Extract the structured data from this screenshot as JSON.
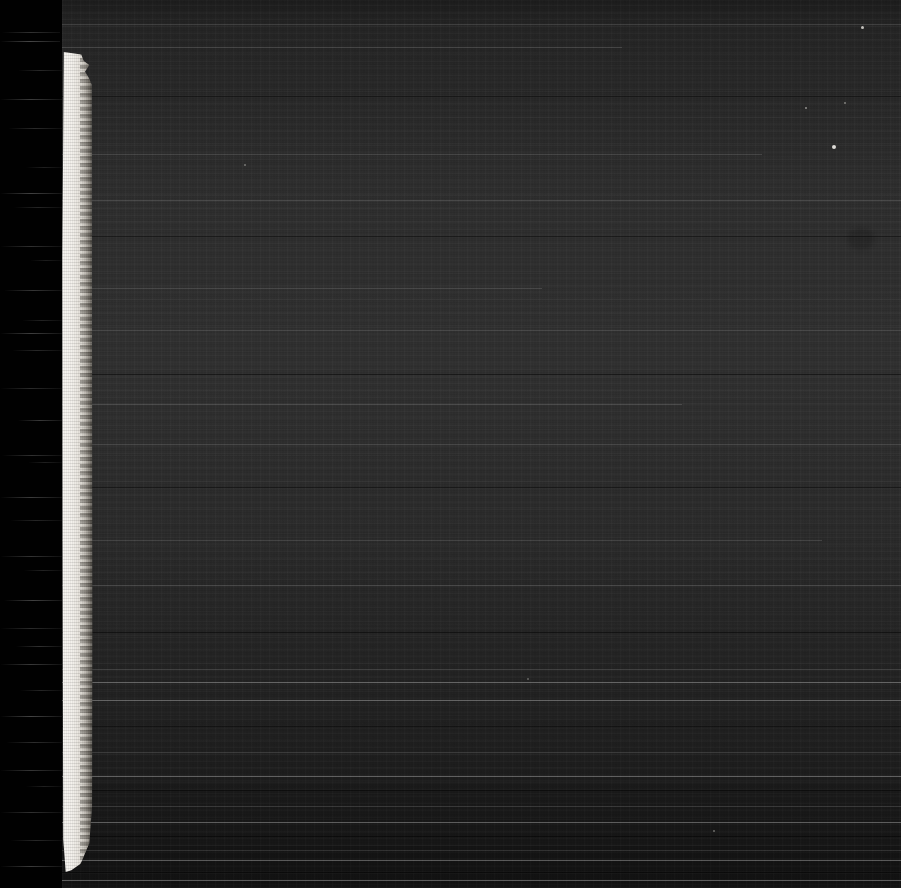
{
  "document": {
    "kind": "scanned-microfilm-frame",
    "title": "Scanned microfilm frame",
    "width_px": 901,
    "height_px": 888,
    "description": "Under-exposed scanned microfilm / microfiche frame. A pure black margin band runs down the left edge, a bright frayed white film-edge strip sits beside it, and the remainder is a dark noisy grey scan field with horizontal banding and a few dust specks. No legible text is present in the frame."
  },
  "regions": {
    "black_margin": {
      "name": "black-margin-band",
      "label": "Black margin band",
      "x": 0,
      "y": 0,
      "width": 62,
      "height": 888,
      "color": "#010101"
    },
    "film_edge_strip": {
      "name": "film-edge-strip",
      "label": "White film edge strip",
      "x": 62,
      "y": 52,
      "width": 31,
      "height": 820,
      "color_bright": "#f6f4f0",
      "color_mid": "#e6e2db",
      "color_edge": "#7d786f",
      "top_shape": "frayed notched tip with small rightward protrusion",
      "bottom_shape": "tapered angled termination"
    },
    "scan_field": {
      "name": "dark-scan-field",
      "label": "Dark scan field",
      "x": 62,
      "y": 0,
      "width": 839,
      "height": 888,
      "color_base": "#272727",
      "color_light_band": "#2e2e2e",
      "color_dark_band": "#161616",
      "texture": "film grain with horizontal scanline banding"
    }
  },
  "streaks": [
    {
      "top": 32,
      "left": 2,
      "width": 58,
      "opacity": 0.35
    },
    {
      "top": 41,
      "left": 0,
      "width": 60,
      "opacity": 0.5
    },
    {
      "top": 70,
      "left": 18,
      "width": 44,
      "opacity": 0.28
    },
    {
      "top": 99,
      "left": 0,
      "width": 62,
      "opacity": 0.42
    },
    {
      "top": 128,
      "left": 8,
      "width": 54,
      "opacity": 0.3
    },
    {
      "top": 167,
      "left": 26,
      "width": 36,
      "opacity": 0.22
    },
    {
      "top": 193,
      "left": 0,
      "width": 62,
      "opacity": 0.46
    },
    {
      "top": 207,
      "left": 14,
      "width": 48,
      "opacity": 0.26
    },
    {
      "top": 246,
      "left": 0,
      "width": 62,
      "opacity": 0.34
    },
    {
      "top": 260,
      "left": 30,
      "width": 32,
      "opacity": 0.2
    },
    {
      "top": 290,
      "left": 4,
      "width": 58,
      "opacity": 0.38
    },
    {
      "top": 320,
      "left": 22,
      "width": 40,
      "opacity": 0.24
    },
    {
      "top": 333,
      "left": 0,
      "width": 62,
      "opacity": 0.44
    },
    {
      "top": 350,
      "left": 12,
      "width": 50,
      "opacity": 0.28
    },
    {
      "top": 388,
      "left": 0,
      "width": 62,
      "opacity": 0.3
    },
    {
      "top": 420,
      "left": 18,
      "width": 44,
      "opacity": 0.4
    },
    {
      "top": 455,
      "left": 2,
      "width": 60,
      "opacity": 0.34
    },
    {
      "top": 462,
      "left": 28,
      "width": 34,
      "opacity": 0.22
    },
    {
      "top": 497,
      "left": 0,
      "width": 62,
      "opacity": 0.42
    },
    {
      "top": 520,
      "left": 10,
      "width": 52,
      "opacity": 0.26
    },
    {
      "top": 556,
      "left": 0,
      "width": 62,
      "opacity": 0.36
    },
    {
      "top": 570,
      "left": 24,
      "width": 38,
      "opacity": 0.24
    },
    {
      "top": 600,
      "left": 4,
      "width": 58,
      "opacity": 0.46
    },
    {
      "top": 628,
      "left": 0,
      "width": 62,
      "opacity": 0.3
    },
    {
      "top": 646,
      "left": 16,
      "width": 46,
      "opacity": 0.34
    },
    {
      "top": 664,
      "left": 0,
      "width": 62,
      "opacity": 0.4
    },
    {
      "top": 690,
      "left": 20,
      "width": 42,
      "opacity": 0.26
    },
    {
      "top": 716,
      "left": 0,
      "width": 62,
      "opacity": 0.48
    },
    {
      "top": 742,
      "left": 6,
      "width": 56,
      "opacity": 0.32
    },
    {
      "top": 770,
      "left": 0,
      "width": 62,
      "opacity": 0.38
    },
    {
      "top": 786,
      "left": 26,
      "width": 36,
      "opacity": 0.22
    },
    {
      "top": 812,
      "left": 0,
      "width": 62,
      "opacity": 0.34
    },
    {
      "top": 840,
      "left": 10,
      "width": 52,
      "opacity": 0.28
    },
    {
      "top": 866,
      "left": 0,
      "width": 62,
      "opacity": 0.42
    }
  ],
  "scan_lines": [
    {
      "top": 24,
      "left": 62,
      "width": 839,
      "tone": "normal"
    },
    {
      "top": 47,
      "left": 62,
      "width": 560,
      "tone": "normal"
    },
    {
      "top": 96,
      "left": 62,
      "width": 839,
      "tone": "dark"
    },
    {
      "top": 154,
      "left": 62,
      "width": 700,
      "tone": "normal"
    },
    {
      "top": 200,
      "left": 62,
      "width": 839,
      "tone": "normal"
    },
    {
      "top": 236,
      "left": 62,
      "width": 839,
      "tone": "dark"
    },
    {
      "top": 288,
      "left": 62,
      "width": 480,
      "tone": "normal"
    },
    {
      "top": 330,
      "left": 62,
      "width": 839,
      "tone": "normal"
    },
    {
      "top": 374,
      "left": 62,
      "width": 839,
      "tone": "dark"
    },
    {
      "top": 404,
      "left": 62,
      "width": 620,
      "tone": "normal"
    },
    {
      "top": 444,
      "left": 62,
      "width": 839,
      "tone": "normal"
    },
    {
      "top": 487,
      "left": 62,
      "width": 839,
      "tone": "dark"
    },
    {
      "top": 540,
      "left": 62,
      "width": 760,
      "tone": "normal"
    },
    {
      "top": 585,
      "left": 62,
      "width": 839,
      "tone": "normal"
    },
    {
      "top": 632,
      "left": 62,
      "width": 839,
      "tone": "dark"
    },
    {
      "top": 669,
      "left": 62,
      "width": 839,
      "tone": "normal"
    },
    {
      "top": 682,
      "left": 62,
      "width": 839,
      "tone": "bright"
    },
    {
      "top": 700,
      "left": 62,
      "width": 839,
      "tone": "bright"
    },
    {
      "top": 726,
      "left": 62,
      "width": 839,
      "tone": "dark"
    },
    {
      "top": 752,
      "left": 62,
      "width": 839,
      "tone": "normal"
    },
    {
      "top": 776,
      "left": 62,
      "width": 839,
      "tone": "bright"
    },
    {
      "top": 790,
      "left": 62,
      "width": 839,
      "tone": "dark"
    },
    {
      "top": 806,
      "left": 62,
      "width": 839,
      "tone": "normal"
    },
    {
      "top": 822,
      "left": 62,
      "width": 839,
      "tone": "bright"
    },
    {
      "top": 836,
      "left": 62,
      "width": 839,
      "tone": "dark"
    },
    {
      "top": 850,
      "left": 62,
      "width": 839,
      "tone": "normal"
    },
    {
      "top": 860,
      "left": 62,
      "width": 839,
      "tone": "bright"
    },
    {
      "top": 872,
      "left": 62,
      "width": 839,
      "tone": "dark"
    },
    {
      "top": 880,
      "left": 62,
      "width": 839,
      "tone": "bright"
    }
  ],
  "lower_bands": [
    {
      "top": 784,
      "height": 104,
      "opacity": 0.18
    },
    {
      "top": 846,
      "height": 42,
      "opacity": 0.26
    }
  ],
  "specks": [
    {
      "name": "dust-speck-top-right",
      "left": 861,
      "top": 26,
      "size": 3,
      "opacity": 0.8
    },
    {
      "name": "dust-speck-right",
      "left": 832,
      "top": 145,
      "size": 4,
      "opacity": 0.95
    },
    {
      "name": "dust-speck-upper",
      "left": 805,
      "top": 107,
      "size": 2,
      "opacity": 0.55
    },
    {
      "name": "dust-speck-mid",
      "left": 844,
      "top": 102,
      "size": 2,
      "opacity": 0.45
    },
    {
      "name": "dust-speck-left",
      "left": 244,
      "top": 164,
      "size": 2,
      "opacity": 0.4
    },
    {
      "name": "dust-speck-lower",
      "left": 527,
      "top": 678,
      "size": 2,
      "opacity": 0.35
    },
    {
      "name": "dust-speck-bottom",
      "left": 713,
      "top": 830,
      "size": 2,
      "opacity": 0.4
    }
  ],
  "smudges": [
    {
      "name": "emulsion-smudge-right",
      "left": 848,
      "top": 228,
      "width": 26,
      "height": 22,
      "opacity": 0.35
    }
  ]
}
